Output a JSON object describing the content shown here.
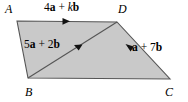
{
  "figure": {
    "name": "vector-parallelogram-ABCD",
    "fill_color": "#c9c9c9",
    "stroke_color": "#4d4d4d",
    "background_color": "#ffffff",
    "vertices": {
      "A": {
        "label": "A",
        "x": 17,
        "y": 21
      },
      "B": {
        "label": "B",
        "x": 28,
        "y": 78
      },
      "C": {
        "label": "C",
        "x": 170,
        "y": 79
      },
      "D": {
        "label": "D",
        "x": 117,
        "y": 22
      }
    },
    "vectors": [
      {
        "id": "AD",
        "from": "A",
        "to": "D",
        "coefficient_a": "4",
        "coefficient_b": "k",
        "parts": {
          "pre": "4",
          "a": "a",
          "plus": " + ",
          "k": "k",
          "b": "b"
        },
        "text": "4a + kb",
        "arrow_direction": "right"
      },
      {
        "id": "BD",
        "from": "B",
        "to": "D",
        "coefficient_a": "5",
        "coefficient_b": "2",
        "parts": {
          "pre": "5",
          "a": "a",
          "plus": " + ",
          "k": "2",
          "b": "b"
        },
        "text": "5a + 2b",
        "arrow_direction": "up-right"
      },
      {
        "id": "CD",
        "from": "C",
        "to": "D",
        "coefficient_a": "1",
        "coefficient_b": "7",
        "parts": {
          "pre": "",
          "a": "a",
          "plus": " + ",
          "k": "7",
          "b": "b"
        },
        "text": "a + 7b",
        "arrow_direction": "up-left"
      }
    ]
  }
}
